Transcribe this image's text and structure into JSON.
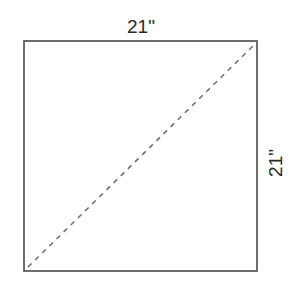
{
  "diagram": {
    "type": "square-with-diagonal",
    "top_label": "21\"",
    "right_label": "21\"",
    "shape": {
      "x": 24,
      "y": 41,
      "width": 233,
      "height": 230,
      "stroke": "#4a4a4a",
      "stroke_width": 1.6
    },
    "diagonal": {
      "style": "dashed",
      "from": "bottom-left",
      "to": "top-right",
      "stroke": "#6a6a6a"
    }
  }
}
